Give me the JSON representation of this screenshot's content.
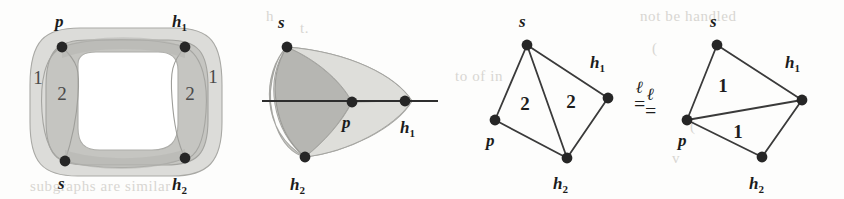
{
  "figure": {
    "caption": "",
    "background_bleed": [
      {
        "text": "h",
        "x": 266,
        "y": 8
      },
      {
        "text": "t.",
        "x": 300,
        "y": 20
      },
      {
        "text": "not be handled",
        "x": 640,
        "y": 8
      },
      {
        "text": "of",
        "x": 60,
        "y": 72
      },
      {
        "text": "a",
        "x": 140,
        "y": 72
      },
      {
        "text": "to of in",
        "x": 455,
        "y": 68
      },
      {
        "text": "(",
        "x": 652,
        "y": 40
      },
      {
        "text": "V",
        "x": 120,
        "y": 110
      },
      {
        "text": "(",
        "x": 690,
        "y": 118
      },
      {
        "text": "v",
        "x": 672,
        "y": 150
      },
      {
        "text": "subgraphs are similar",
        "x": 30,
        "y": 178
      }
    ]
  },
  "panels": [
    {
      "id": "panel-1-thickened-ring",
      "name": "ribbon-ring-embedding",
      "x": 18,
      "width": 215,
      "nodes": [
        {
          "id": "p",
          "label": "p",
          "sub": "",
          "cx": 62,
          "cy": 47,
          "lx": 55,
          "ly": 27
        },
        {
          "id": "h1",
          "label": "h",
          "sub": "1",
          "cx": 185,
          "cy": 47,
          "lx": 172,
          "ly": 27
        },
        {
          "id": "s",
          "label": "s",
          "sub": "",
          "cx": 65,
          "cy": 161,
          "lx": 58,
          "ly": 189
        },
        {
          "id": "h2",
          "label": "h",
          "sub": "2",
          "cx": 185,
          "cy": 158,
          "lx": 172,
          "ly": 190
        }
      ],
      "face_labels": [
        {
          "text": "1",
          "x": 38,
          "y": 84
        },
        {
          "text": "2",
          "x": 62,
          "y": 100
        },
        {
          "text": "2",
          "x": 190,
          "y": 100
        },
        {
          "text": "1",
          "x": 213,
          "y": 83
        }
      ]
    },
    {
      "id": "panel-2-sphere-triangle",
      "name": "curved-triangle-embedding",
      "x": 255,
      "width": 190,
      "nodes": [
        {
          "id": "s",
          "label": "s",
          "sub": "",
          "cx": 287,
          "cy": 47,
          "lx": 278,
          "ly": 28
        },
        {
          "id": "h2",
          "label": "h",
          "sub": "2",
          "cx": 305,
          "cy": 157,
          "lx": 290,
          "ly": 190
        },
        {
          "id": "p",
          "label": "p",
          "sub": "",
          "cx": 352,
          "cy": 102,
          "lx": 342,
          "ly": 128
        },
        {
          "id": "h1",
          "label": "h",
          "sub": "1",
          "cx": 405,
          "cy": 101,
          "lx": 400,
          "ly": 133
        }
      ],
      "face_labels": []
    },
    {
      "id": "panel-3-graph-weight-2",
      "name": "planar-graph-faces-2",
      "x": 465,
      "width": 170,
      "nodes": [
        {
          "id": "s",
          "label": "s",
          "sub": "",
          "cx": 527,
          "cy": 45,
          "lx": 519,
          "ly": 27
        },
        {
          "id": "p",
          "label": "p",
          "sub": "",
          "cx": 495,
          "cy": 120,
          "lx": 486,
          "ly": 146
        },
        {
          "id": "h2",
          "label": "h",
          "sub": "2",
          "cx": 567,
          "cy": 158,
          "lx": 553,
          "ly": 189
        },
        {
          "id": "h1",
          "label": "h",
          "sub": "1",
          "cx": 608,
          "cy": 98,
          "lx": 590,
          "ly": 68
        }
      ],
      "edges": [
        [
          "s",
          "p"
        ],
        [
          "s",
          "h2"
        ],
        [
          "s",
          "h1"
        ],
        [
          "p",
          "h2"
        ],
        [
          "h2",
          "h1"
        ]
      ],
      "face_labels": [
        {
          "text": "2",
          "x": 525,
          "y": 110
        },
        {
          "text": "2",
          "x": 571,
          "y": 108
        }
      ]
    },
    {
      "id": "panel-4-graph-weight-1",
      "name": "planar-graph-faces-1",
      "x": 660,
      "width": 175,
      "nodes": [
        {
          "id": "s",
          "label": "s",
          "sub": "",
          "cx": 717,
          "cy": 45,
          "lx": 710,
          "ly": 27
        },
        {
          "id": "p",
          "label": "p",
          "sub": "",
          "cx": 687,
          "cy": 120,
          "lx": 678,
          "ly": 146
        },
        {
          "id": "h2",
          "label": "h",
          "sub": "2",
          "cx": 762,
          "cy": 157,
          "lx": 749,
          "ly": 189
        },
        {
          "id": "h1",
          "label": "h",
          "sub": "1",
          "cx": 802,
          "cy": 100,
          "lx": 785,
          "ly": 68
        }
      ],
      "edges": [
        [
          "s",
          "p"
        ],
        [
          "s",
          "h1"
        ],
        [
          "p",
          "h1"
        ],
        [
          "p",
          "h2"
        ],
        [
          "h2",
          "h1"
        ]
      ],
      "face_labels": [
        {
          "text": "1",
          "x": 723,
          "y": 92
        },
        {
          "text": "1",
          "x": 738,
          "y": 138
        }
      ]
    }
  ],
  "relation_symbols": [
    {
      "id": "equiv-1",
      "top": "ℓ",
      "bottom": "=",
      "x": 634,
      "y": 79
    },
    {
      "id": "equiv-2",
      "top": "ℓ",
      "bottom": "=",
      "x": 645,
      "y": 86
    }
  ],
  "colors": {
    "ink": "#1d1d1d",
    "edge": "#3a3a3a",
    "node_fill": "#262626",
    "shade_light": "#d9d9d6",
    "shade_mid": "#c2c2bf",
    "shade_dark": "#aaaaa6",
    "outline": "#9a9a96",
    "paper": "#fdfdfc",
    "bleed_text": "#dcdad6"
  }
}
